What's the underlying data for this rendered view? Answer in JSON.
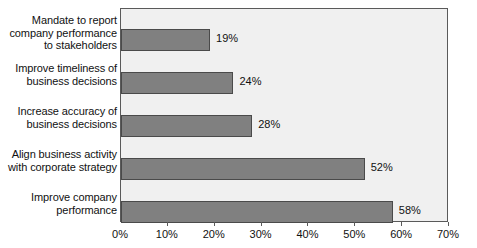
{
  "chart_data": {
    "type": "bar",
    "orientation": "horizontal",
    "title": "",
    "xlabel": "",
    "ylabel": "",
    "categories": [
      "Mandate to report\ncompany performance\nto stakeholders",
      "Improve timeliness of\nbusiness decisions",
      "Increase accuracy of\nbusiness decisions",
      "Align business activity\nwith corporate strategy",
      "Improve company\nperformance"
    ],
    "values": [
      19,
      24,
      28,
      52,
      58
    ],
    "value_labels": [
      "19%",
      "24%",
      "28%",
      "52%",
      "58%"
    ],
    "xlim": [
      0,
      70
    ],
    "xticks": [
      0,
      10,
      20,
      30,
      40,
      50,
      60,
      70
    ],
    "xtick_labels": [
      "0%",
      "10%",
      "20%",
      "30%",
      "40%",
      "50%",
      "60%",
      "70%"
    ],
    "grid": false,
    "legend": false,
    "bar_color": "#808080",
    "bar_edge_color": "#4a4a4a",
    "plot_background": "#f0f0f0",
    "plot_border_color": "#5a5a5a",
    "page_background": "#ffffff",
    "text_color": "#111111"
  },
  "caption": {
    "clipped_text": "cut off text at bottom edge"
  }
}
